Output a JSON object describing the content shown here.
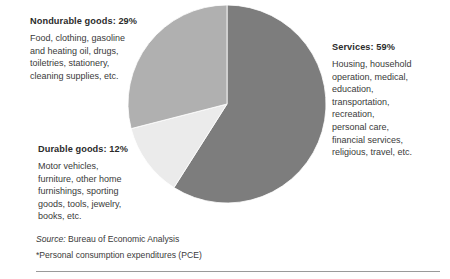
{
  "figure": {
    "background_color": "#ffffff",
    "rule_color": "#9a9a9a"
  },
  "chart_data": {
    "type": "pie",
    "title": "",
    "subtitle": "",
    "xlabel": "",
    "ylabel": "",
    "legend_position": "callout-labels",
    "grid": false,
    "units": "percent",
    "start_angle_deg": 0,
    "direction": "clockwise",
    "categories": [
      "Services",
      "Durable goods",
      "Nondurable goods"
    ],
    "values": [
      59,
      12,
      29
    ],
    "colors": [
      "#7d7d7d",
      "#ebebeb",
      "#b0b0b0"
    ],
    "slices": [
      {
        "name": "Services",
        "value": 59,
        "label": "Services: 59%",
        "color": "#7d7d7d",
        "start_deg": 0,
        "end_deg": 212.4
      },
      {
        "name": "Durable goods",
        "value": 12,
        "label": "Durable goods: 12%",
        "color": "#ebebeb",
        "start_deg": 212.4,
        "end_deg": 255.6
      },
      {
        "name": "Nondurable goods",
        "value": 29,
        "label": "Nondurable goods: 29%",
        "color": "#b0b0b0",
        "start_deg": 255.6,
        "end_deg": 360
      }
    ]
  },
  "callouts": {
    "nondurable": {
      "heading": "Nondurable goods: 29%",
      "lines": [
        "Food, clothing, gasoline",
        "and heating oil, drugs,",
        "toiletries, stationery,",
        "cleaning supplies, etc."
      ]
    },
    "durable": {
      "heading": "Durable goods: 12%",
      "lines": [
        "Motor vehicles,",
        "furniture, other home",
        "furnishings, sporting",
        "goods, tools, jewelry,",
        "books, etc."
      ]
    },
    "services": {
      "heading": "Services: 59%",
      "lines": [
        "Housing, household",
        "operation, medical,",
        "education,",
        "transportation,",
        "recreation,",
        "personal care,",
        "financial services,",
        "religious, travel, etc."
      ]
    }
  },
  "footer": {
    "source_label": "Source:",
    "source_text": " Bureau of Economic Analysis",
    "footnote": "*Personal consumption expenditures (PCE)"
  }
}
